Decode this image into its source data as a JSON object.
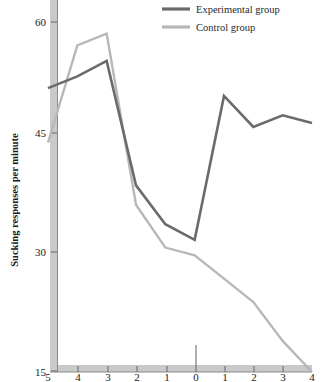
{
  "chart_data": {
    "type": "line",
    "title": "",
    "subtitle": "",
    "xlabel": "",
    "ylabel": "Sucking responses per minute",
    "x": [
      -5,
      -4,
      -3,
      -2,
      -1,
      0,
      1,
      2,
      3,
      4
    ],
    "xtick_labels": [
      "5",
      "4",
      "3",
      "2",
      "1",
      "0",
      "1",
      "2",
      "3",
      "4"
    ],
    "ytick_labels": [
      "60",
      "45",
      "30",
      "15"
    ],
    "ytick_values": [
      60,
      45,
      30,
      15
    ],
    "ylim": [
      15,
      63
    ],
    "xlim": [
      -5,
      4
    ],
    "grid": false,
    "legend_position": "top-right",
    "series": [
      {
        "name": "Experimental group",
        "color": "#6b6b6b",
        "values": [
          51.5,
          53.0,
          55.0,
          39.0,
          34.0,
          32.0,
          50.5,
          46.5,
          48.0,
          47.0
        ]
      },
      {
        "name": "Control group",
        "color": "#b8b8b8",
        "values": [
          44.5,
          57.0,
          58.5,
          36.5,
          31.0,
          30.0,
          27.0,
          24.0,
          19.0,
          15.0
        ]
      }
    ],
    "annotations": []
  },
  "legend": {
    "items": [
      {
        "label": "Experimental group",
        "color": "#6b6b6b"
      },
      {
        "label": "Control group",
        "color": "#b8b8b8"
      }
    ]
  },
  "axes": {
    "y_axis_title": "Sucking responses per minute",
    "y_ticks": [
      "60",
      "45",
      "30",
      "15"
    ],
    "x_ticks": [
      "5",
      "4",
      "3",
      "2",
      "1",
      "0",
      "1",
      "2",
      "3",
      "4"
    ]
  }
}
